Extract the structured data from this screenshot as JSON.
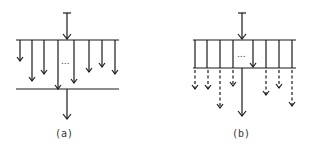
{
  "figure": {
    "panels": [
      {
        "id": "a",
        "label": "(a)",
        "ellipsis": "...",
        "description": "Input arrow into a horizontal bar; several parallel downward arrows of varying length; one reaches a lower bar which emits a single output arrow."
      },
      {
        "id": "b",
        "label": "(b)",
        "ellipsis": "...",
        "description": "Input arrow into a ladder of vertical lines between two bars; dashed downward arrows of varying length leave the lower bar; one long solid output arrow."
      }
    ],
    "colors": {
      "stroke": "#1a1a1a",
      "background": "#ffffff"
    }
  }
}
